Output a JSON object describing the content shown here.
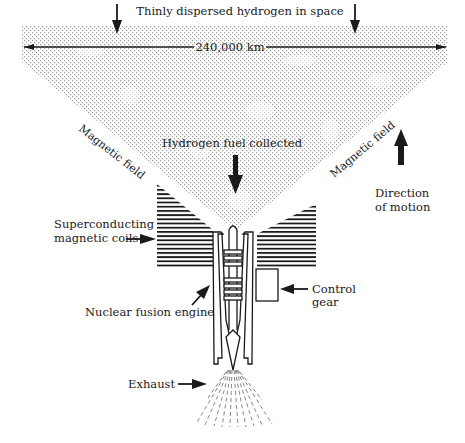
{
  "diagram": {
    "labels": {
      "hydrogen_space": "Thinly dispersed hydrogen in space",
      "width": "240,000 km",
      "magnetic_field_left": "Magnetic field",
      "magnetic_field_right": "Magnetic field",
      "fuel_collected": "Hydrogen fuel collected",
      "direction_line1": "Direction",
      "direction_line2": "of motion",
      "coils_line1": "Superconducting",
      "coils_line2": "magnetic coils",
      "control_line1": "Control",
      "control_line2": "gear",
      "engine": "Nuclear fusion engine",
      "exhaust": "Exhaust"
    },
    "colors": {
      "ink": "#1a1a1a",
      "stipple": "#8a8a8a",
      "background": "#ffffff"
    }
  }
}
